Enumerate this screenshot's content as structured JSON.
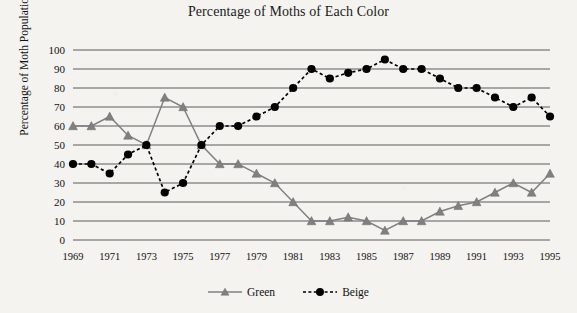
{
  "chart_data": {
    "type": "line",
    "title": "Percentage of Moths of Each Color",
    "xlabel": "",
    "ylabel": "Percentage of Moth Population",
    "ylim": [
      0,
      100
    ],
    "ytick_step": 10,
    "yticks": [
      100,
      90,
      80,
      70,
      60,
      50,
      40,
      30,
      20,
      10,
      0
    ],
    "xlim": [
      1969,
      1995
    ],
    "xticks": [
      1969,
      1971,
      1973,
      1975,
      1977,
      1979,
      1981,
      1983,
      1985,
      1987,
      1989,
      1991,
      1993,
      1995
    ],
    "x": [
      1969,
      1970,
      1971,
      1972,
      1973,
      1974,
      1975,
      1976,
      1977,
      1978,
      1979,
      1980,
      1981,
      1982,
      1983,
      1984,
      1985,
      1986,
      1987,
      1988,
      1989,
      1990,
      1991,
      1992,
      1993,
      1994,
      1995
    ],
    "grid": true,
    "legend_position": "bottom",
    "series": [
      {
        "name": "Green",
        "color": "#808080",
        "marker": "triangle",
        "linestyle": "solid",
        "values": [
          60,
          60,
          65,
          55,
          50,
          75,
          70,
          50,
          40,
          40,
          35,
          30,
          20,
          10,
          10,
          12,
          10,
          5,
          10,
          10,
          15,
          18,
          20,
          25,
          30,
          25,
          35
        ]
      },
      {
        "name": "Beige",
        "color": "#000000",
        "marker": "circle",
        "linestyle": "dashed",
        "values": [
          40,
          40,
          35,
          45,
          50,
          25,
          30,
          50,
          60,
          60,
          65,
          70,
          80,
          90,
          85,
          88,
          90,
          95,
          90,
          90,
          85,
          80,
          80,
          75,
          70,
          75,
          65
        ]
      }
    ]
  },
  "legend": {
    "items": [
      {
        "label": "Green"
      },
      {
        "label": "Beige"
      }
    ]
  }
}
